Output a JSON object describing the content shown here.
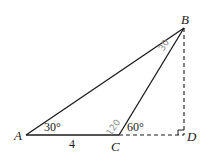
{
  "diagram": {
    "type": "geometry-triangle",
    "points": {
      "A": {
        "label": "A",
        "x": 26,
        "y": 135
      },
      "B": {
        "label": "B",
        "x": 184,
        "y": 28
      },
      "C": {
        "label": "C",
        "x": 119,
        "y": 135
      },
      "D": {
        "label": "D",
        "x": 184,
        "y": 135
      }
    },
    "segments": [
      {
        "from": "A",
        "to": "B",
        "style": "solid"
      },
      {
        "from": "A",
        "to": "C",
        "style": "solid"
      },
      {
        "from": "C",
        "to": "B",
        "style": "solid"
      },
      {
        "from": "C",
        "to": "D",
        "style": "dashed"
      },
      {
        "from": "B",
        "to": "D",
        "style": "dashed"
      }
    ],
    "annotations": {
      "angle_A": "30°",
      "angle_BCD": "60°",
      "side_AC": "4",
      "handwritten_angle_ACB": "120",
      "handwritten_angle_ABC": "30",
      "right_angle_at": "D"
    },
    "colors": {
      "line": "#1a1a1a",
      "handwriting": "#8a8a8a",
      "background": "#ffffff"
    }
  }
}
